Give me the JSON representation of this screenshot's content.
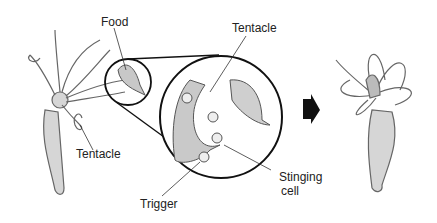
{
  "diagram": {
    "labels": {
      "food": "Food",
      "tentacle_left": "Tentacle",
      "tentacle_zoom": "Tentacle",
      "trigger": "Trigger",
      "stinging_line1": "Stinging",
      "stinging_line2": "cell"
    },
    "panels": [
      {
        "name": "hydra-with-food",
        "description": "Hydra reaching tentacle toward food"
      },
      {
        "name": "magnified-tentacle",
        "description": "Close-up of tentacle with stinging cells and triggers gripping prey"
      },
      {
        "name": "hydra-after-capture",
        "description": "Hydra tentacles wrapped around captured food"
      }
    ],
    "colors": {
      "body_fill": "#d4d4d4",
      "outline": "#555555",
      "circle_stroke": "#111111",
      "arrow": "#111111"
    }
  }
}
